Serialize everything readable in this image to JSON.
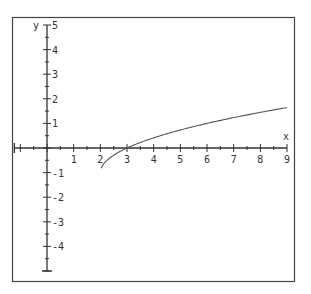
{
  "chart_data": {
    "type": "line",
    "title": "",
    "xlabel": "x",
    "ylabel": "y",
    "xlim": [
      -1,
      9
    ],
    "ylim": [
      -5,
      5
    ],
    "x_ticks": [
      1,
      2,
      3,
      4,
      5,
      6,
      7,
      8,
      9
    ],
    "y_ticks": [
      5,
      4,
      3,
      2,
      1,
      -1,
      -2,
      -3,
      -4
    ],
    "x_tick_labels": [
      "1",
      "2",
      "3",
      "4",
      "5",
      "6",
      "7",
      "8",
      "9"
    ],
    "y_tick_labels": [
      "5",
      "4",
      "3",
      "2",
      "1",
      "-1",
      "-2",
      "-3",
      "-4"
    ],
    "minor_ticks": "half-unit",
    "grid": false,
    "legend": null,
    "series": [
      {
        "name": "y = sqrt(x - 2) - 1",
        "x": [
          2,
          2.25,
          2.5,
          3,
          3.5,
          4,
          5,
          6,
          7,
          8,
          9
        ],
        "y": [
          -1,
          -0.5,
          -0.29,
          0,
          0.22,
          0.41,
          0.73,
          1.0,
          1.24,
          1.45,
          1.65
        ]
      }
    ]
  },
  "colors": {
    "axis": "#333333",
    "curve": "#555555",
    "frame": "#444444",
    "background": "#ffffff"
  }
}
